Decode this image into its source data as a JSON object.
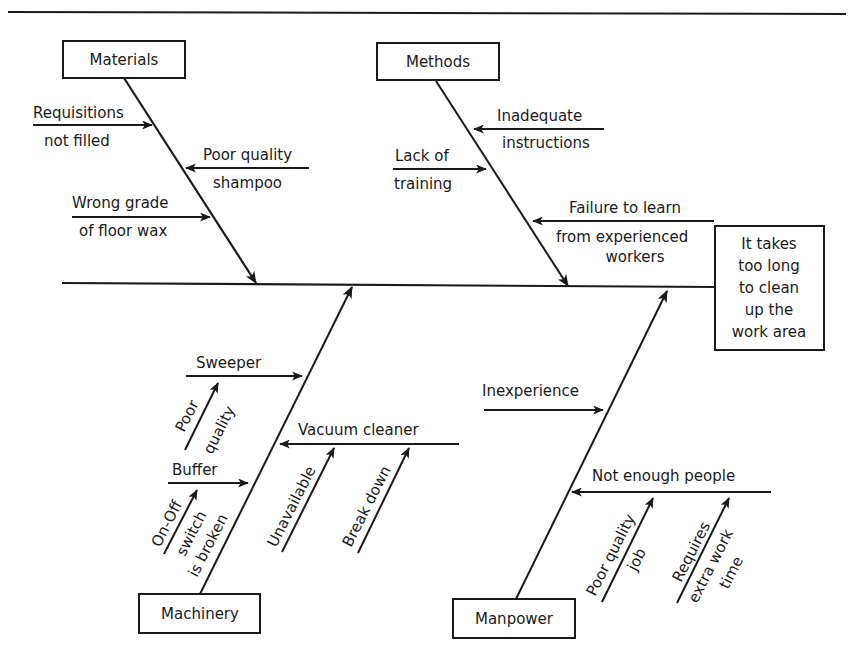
{
  "diagram": {
    "type": "fishbone (cause-and-effect / Ishikawa)",
    "effect": {
      "lines": [
        "It takes",
        "too long",
        "to clean",
        "up the",
        "work area"
      ]
    },
    "categories": {
      "materials": {
        "label": "Materials",
        "causes": {
          "requisitions": [
            "Requisitions",
            "not filled"
          ],
          "shampoo": [
            "Poor quality",
            "shampoo"
          ],
          "floor_wax": [
            "Wrong grade",
            "of floor wax"
          ]
        }
      },
      "methods": {
        "label": "Methods",
        "causes": {
          "instructions": [
            "Inadequate",
            "instructions"
          ],
          "training": [
            "Lack of",
            "training"
          ],
          "failure": [
            "Failure to learn",
            "from experienced",
            "workers"
          ]
        }
      },
      "machinery": {
        "label": "Machinery",
        "causes": {
          "sweeper": {
            "label": "Sweeper",
            "sub": [
              "Poor",
              "quality"
            ]
          },
          "buffer": {
            "label": "Buffer",
            "sub": [
              "On-Off",
              "switch",
              "is broken"
            ]
          },
          "vacuum": {
            "label": "Vacuum cleaner",
            "sub1": "Unavailable",
            "sub2": "Break down"
          }
        }
      },
      "manpower": {
        "label": "Manpower",
        "causes": {
          "inexperience": {
            "label": "Inexperience"
          },
          "people": {
            "label": "Not enough people",
            "sub1": [
              "Poor quality",
              "job"
            ],
            "sub2": [
              "Requires",
              "extra work",
              "time"
            ]
          }
        }
      }
    },
    "colors": {
      "ink": "#1a1a1a",
      "background": "#ffffff"
    }
  }
}
